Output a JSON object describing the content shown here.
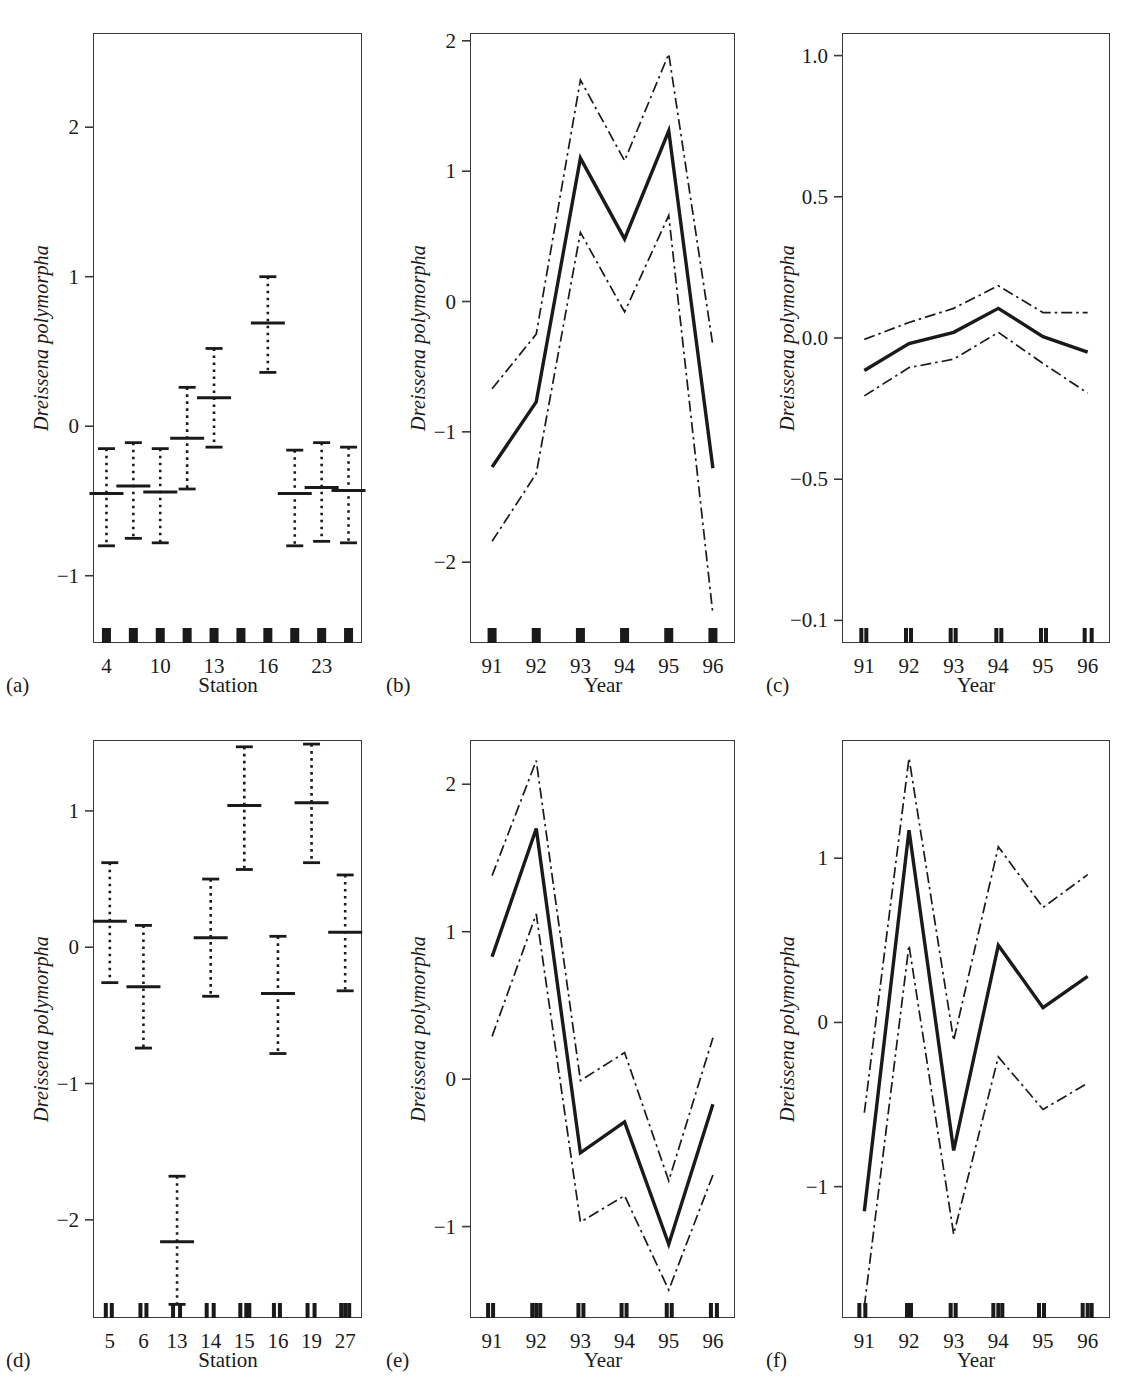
{
  "figure": {
    "ylabel": "Dreissena polymorpha",
    "xlabel_station": "Station",
    "xlabel_year": "Year",
    "panel_labels": [
      "(a)",
      "(b)",
      "(c)",
      "(d)",
      "(e)",
      "(f)"
    ],
    "line_color": "#1a1a1a",
    "frame_color": "#3a3a3a"
  },
  "chart_data": [
    {
      "panel": "(a)",
      "type": "scatter",
      "title": "",
      "xlabel": "Station",
      "ylabel": "Dreissena polymorpha",
      "xtick_labels": [
        "4",
        "",
        "10",
        "",
        "13",
        "",
        "16",
        "",
        "23",
        ""
      ],
      "ytick_labels": [
        "2",
        "1",
        "0",
        "-1"
      ],
      "ytick_values": [
        2,
        1,
        0,
        -1
      ],
      "ylim": [
        -1.45,
        2.63
      ],
      "grid": false,
      "legend": "none",
      "categories": [
        "4",
        "",
        "10",
        "",
        "13",
        "",
        "16",
        "",
        "23",
        ""
      ],
      "values": [
        -0.45,
        -0.4,
        -0.44,
        -0.08,
        0.19,
        null,
        0.69,
        -0.45,
        -0.41,
        -0.43
      ],
      "upper": [
        -0.15,
        -0.11,
        -0.15,
        0.26,
        0.52,
        null,
        1.0,
        -0.16,
        -0.11,
        -0.14
      ],
      "lower": [
        -0.8,
        -0.75,
        -0.78,
        -0.42,
        -0.14,
        null,
        0.36,
        -0.8,
        -0.77,
        -0.78
      ],
      "rug_count": 10,
      "notes": "partial residual / smoother estimates with 95% pointwise confidence intervals; dotted vertical bars, solid caps"
    },
    {
      "panel": "(b)",
      "type": "line",
      "title": "",
      "xlabel": "Year",
      "ylabel": "Dreissena polymorpha",
      "xtick_labels": [
        "91",
        "92",
        "93",
        "94",
        "95",
        "96"
      ],
      "ytick_labels": [
        "2",
        "1",
        "0",
        "-1",
        "-2"
      ],
      "ytick_values": [
        2,
        1,
        0,
        -1,
        -2
      ],
      "ylim": [
        -2.62,
        2.06
      ],
      "grid": false,
      "legend": "none",
      "x": [
        91,
        92,
        93,
        94,
        95,
        96
      ],
      "series": [
        {
          "name": "smoother",
          "style": "solid",
          "values": [
            -1.27,
            -0.77,
            1.1,
            0.48,
            1.31,
            -1.28
          ]
        },
        {
          "name": "upper 95% CI",
          "style": "dashdot",
          "values": [
            -0.67,
            -0.25,
            1.7,
            1.08,
            1.9,
            -0.34
          ]
        },
        {
          "name": "lower 95% CI",
          "style": "dashdot",
          "values": [
            -1.84,
            -1.32,
            0.53,
            -0.08,
            0.66,
            -2.4
          ]
        }
      ],
      "rug_count": 6
    },
    {
      "panel": "(c)",
      "type": "line",
      "title": "",
      "xlabel": "Year",
      "ylabel": "Dreissena polymorpha",
      "xtick_labels": [
        "91",
        "92",
        "93",
        "94",
        "95",
        "96"
      ],
      "ytick_labels": [
        "1.0",
        "0.5",
        "0.0",
        "-0.5",
        "-0.1"
      ],
      "ytick_values": [
        1.0,
        0.5,
        0.0,
        -0.5,
        -1.0
      ],
      "ylim": [
        -1.08,
        1.08
      ],
      "grid": false,
      "legend": "none",
      "x": [
        91,
        92,
        93,
        94,
        95,
        96
      ],
      "series": [
        {
          "name": "smoother",
          "style": "solid",
          "values": [
            -0.115,
            -0.02,
            0.02,
            0.105,
            0.005,
            -0.05
          ]
        },
        {
          "name": "upper 95% CI",
          "style": "dashdot",
          "values": [
            -0.005,
            0.055,
            0.105,
            0.185,
            0.09,
            0.09
          ]
        },
        {
          "name": "lower 95% CI",
          "style": "dashdot",
          "values": [
            -0.205,
            -0.105,
            -0.075,
            0.02,
            -0.09,
            -0.195
          ]
        }
      ],
      "rug_count": 6,
      "notes": "bottom y tick label printed as -0.1 in the original figure (apparent typo for -1.0)"
    },
    {
      "panel": "(d)",
      "type": "scatter",
      "title": "",
      "xlabel": "Station",
      "ylabel": "Dreissena polymorpha",
      "xtick_labels": [
        "5",
        "6",
        "13",
        "14",
        "15",
        "16",
        "19",
        "27"
      ],
      "ytick_labels": [
        "1",
        "0",
        "-1",
        "-2"
      ],
      "ytick_values": [
        1,
        0,
        -1,
        -2
      ],
      "ylim": [
        -2.72,
        1.52
      ],
      "grid": false,
      "legend": "none",
      "categories": [
        "5",
        "6",
        "13",
        "14",
        "15",
        "16",
        "19",
        "27"
      ],
      "values": [
        0.19,
        -0.29,
        -2.16,
        0.07,
        1.04,
        -0.34,
        1.06,
        0.11
      ],
      "upper": [
        0.62,
        0.16,
        -1.68,
        0.5,
        1.47,
        0.08,
        1.49,
        0.53
      ],
      "lower": [
        -0.26,
        -0.74,
        -2.62,
        -0.36,
        0.57,
        -0.78,
        0.62,
        -0.32
      ],
      "rug_count": 8
    },
    {
      "panel": "(e)",
      "type": "line",
      "title": "",
      "xlabel": "Year",
      "ylabel": "Dreissena polymorpha",
      "xtick_labels": [
        "91",
        "92",
        "93",
        "94",
        "95",
        "96"
      ],
      "ytick_labels": [
        "2",
        "1",
        "0",
        "-1"
      ],
      "ytick_values": [
        2,
        1,
        0,
        -1
      ],
      "ylim": [
        -1.62,
        2.3
      ],
      "grid": false,
      "legend": "none",
      "x": [
        91,
        92,
        93,
        94,
        95,
        96
      ],
      "series": [
        {
          "name": "smoother",
          "style": "solid",
          "values": [
            0.83,
            1.7,
            -0.5,
            -0.29,
            -1.12,
            -0.17
          ]
        },
        {
          "name": "upper 95% CI",
          "style": "dashdot",
          "values": [
            1.38,
            2.16,
            -0.01,
            0.18,
            -0.69,
            0.28
          ]
        },
        {
          "name": "lower 95% CI",
          "style": "dashdot",
          "values": [
            0.29,
            1.12,
            -0.97,
            -0.79,
            -1.43,
            -0.65
          ]
        }
      ],
      "rug_count": 6
    },
    {
      "panel": "(f)",
      "type": "line",
      "title": "",
      "xlabel": "Year",
      "ylabel": "Dreissena polymorpha",
      "xtick_labels": [
        "91",
        "92",
        "93",
        "94",
        "95",
        "96"
      ],
      "ytick_labels": [
        "1",
        "0",
        "-1"
      ],
      "ytick_values": [
        1,
        0,
        -1
      ],
      "ylim": [
        -1.8,
        1.72
      ],
      "grid": false,
      "legend": "none",
      "x": [
        91,
        92,
        93,
        94,
        95,
        96
      ],
      "series": [
        {
          "name": "smoother",
          "style": "solid",
          "values": [
            -1.15,
            1.17,
            -0.78,
            0.47,
            0.09,
            0.28
          ]
        },
        {
          "name": "upper 95% CI",
          "style": "dashdot",
          "values": [
            -0.55,
            1.61,
            -0.11,
            1.07,
            0.7,
            0.9
          ]
        },
        {
          "name": "lower 95% CI",
          "style": "dashdot",
          "values": [
            -1.73,
            0.47,
            -1.29,
            -0.21,
            -0.53,
            -0.37
          ]
        }
      ],
      "rug_count": 6
    }
  ]
}
